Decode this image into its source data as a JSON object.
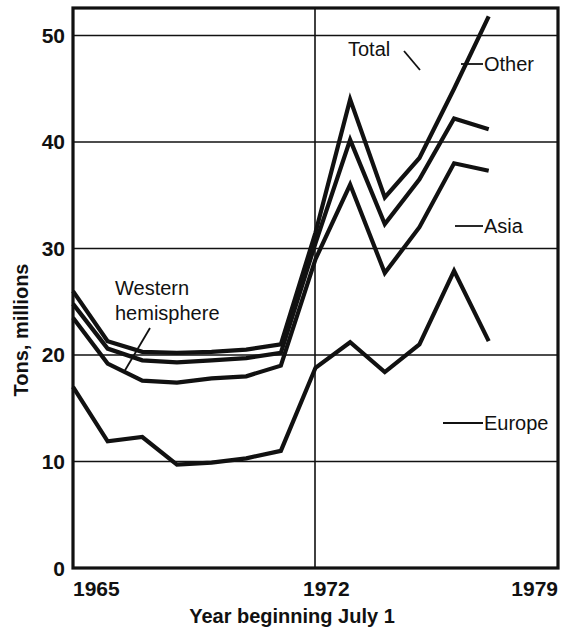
{
  "chart_data": {
    "type": "line",
    "title": "",
    "xlabel": "Year beginning July 1",
    "ylabel": "Tons, millions",
    "xlim": [
      1965,
      1979
    ],
    "ylim": [
      0,
      52
    ],
    "grid": true,
    "grid_axis": "y",
    "legend_position": "inline-right",
    "x_tick_labels": [
      "1965",
      "1972",
      "1979"
    ],
    "x_ticks": [
      1965,
      1972,
      1979
    ],
    "y_tick_labels": [
      "0",
      "10",
      "20",
      "30",
      "40",
      "50"
    ],
    "y_ticks": [
      0,
      10,
      20,
      30,
      40,
      50
    ],
    "x": [
      1965,
      1966,
      1967,
      1968,
      1969,
      1970,
      1971,
      1972,
      1973,
      1974,
      1975,
      1976,
      1977
    ],
    "series": [
      {
        "name": "Total",
        "label": "Total",
        "values": [
          26.0,
          21.3,
          20.3,
          20.2,
          20.3,
          20.5,
          21.0,
          31.5,
          44.0,
          34.8,
          38.5,
          45.0,
          51.8
        ]
      },
      {
        "name": "Other",
        "label": "Other",
        "values": [
          24.8,
          20.6,
          19.5,
          19.3,
          19.5,
          19.7,
          20.2,
          30.5,
          40.2,
          32.3,
          36.5,
          42.2,
          41.2
        ]
      },
      {
        "name": "Asia",
        "label": "Asia",
        "values": [
          23.5,
          19.2,
          17.6,
          17.4,
          17.8,
          18.0,
          19.0,
          29.0,
          36.0,
          27.7,
          32.0,
          38.0,
          37.3
        ]
      },
      {
        "name": "Europe",
        "label": "Europe",
        "values": [
          17.0,
          11.9,
          12.3,
          9.7,
          9.9,
          10.3,
          11.0,
          18.8,
          21.2,
          18.4,
          21.0,
          27.9,
          21.3
        ]
      }
    ],
    "annotations": [
      {
        "text": "Western",
        "text2": "hemisphere",
        "name": "western-hemisphere-annotation",
        "points_to_year": 1967.6,
        "points_to_value": 20.3
      },
      {
        "text": "Total",
        "name": "total-annotation",
        "points_to_year": 1974.1,
        "points_to_value": 43.0
      }
    ],
    "inline_legend": [
      {
        "name": "Other",
        "label": "Other"
      },
      {
        "name": "Asia",
        "label": "Asia"
      },
      {
        "name": "Europe",
        "label": "Europe"
      }
    ],
    "colors": {
      "line": "#111111",
      "background": "#ffffff",
      "axis": "#111111"
    }
  }
}
